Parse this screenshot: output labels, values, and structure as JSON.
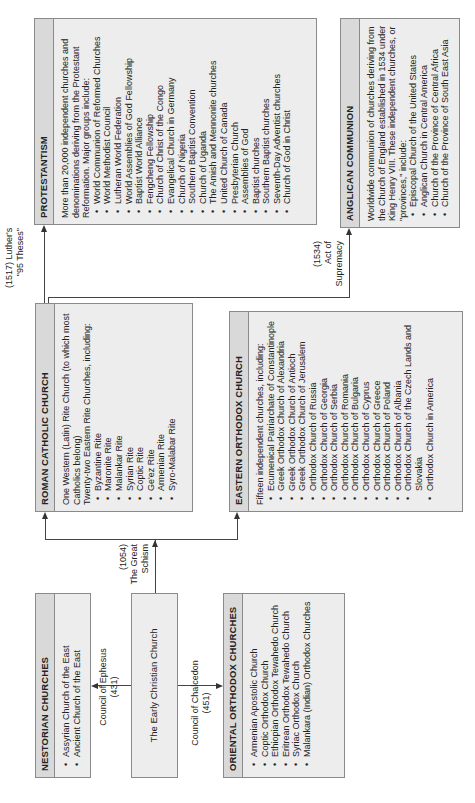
{
  "boxes": {
    "protestantism": {
      "title": "PROTESTANTISM",
      "intro": "More than 20,000 independent churches and denominations deriving from the Protestant Reformation. Major groups include:",
      "items": [
        "World Communion of Reformed Churches",
        "World Methodist Council",
        "Lutheran World Federation",
        "World Assemblies of God Fellowship",
        "Baptist World Alliance",
        "Fengcheng Fellowship",
        "Church of Christ of the Congo",
        "Evangelical Church in Germany",
        "Church of Nigeria",
        "Southern Baptist Convention",
        "Church of Uganda",
        "The Amish and Mennonite churches",
        "United Church of Canada",
        "Presbyterian Church",
        "Assemblies of God",
        "Baptist churches",
        "Southern Baptist churches",
        "Seventh-Day Adventist churches",
        "Church of God in Christ"
      ]
    },
    "anglican": {
      "title": "ANGLICAN COMMUNION",
      "intro": "Worldwide communion of churches deriving from the Church of England established in 1534 under King Henry VIII. These independent churches, or \"provinces,\" include:",
      "items": [
        "Episcopal Church of the United States",
        "Anglican Church in Central America",
        "Church of the Province of Central Africa",
        "Church of the Province of South East Asia"
      ]
    },
    "roman_catholic": {
      "title": "ROMAN CATHOLIC CHURCH",
      "intro": "One Western (Latin) Rite Church (to which most Catholics belong)",
      "intro2": "Twenty-two Eastern Rite Churches, including:",
      "items": [
        "Byzantine Rite",
        "Maronite Rite",
        "Malankar Rite",
        "Syrian Rite",
        "Coptic Rite",
        "Ge'ez Rite",
        "Armenian Rite",
        "Syro-Malabar Rite"
      ]
    },
    "eastern_orthodox": {
      "title": "EASTERN ORTHODOX CHURCH",
      "intro": "Fifteen independent churches, including:",
      "items": [
        "Ecumenical Patriarchate of Constantinople",
        "Greek Orthodox Church of Alexandria",
        "Greek Orthodox Church of Antioch",
        "Greek Orthodox Church of Jerusalem",
        "Orthodox Church of Russia",
        "Orthodox Church of Georgia",
        "Orthodox Church of Serbia",
        "Orthodox Church of Romania",
        "Orthodox Church of Bulgaria",
        "Orthodox Church of Cyprus",
        "Orthodox Church of Greece",
        "Orthodox Church of Poland",
        "Orthodox Church of Albania",
        "Orthodox Church of the Czech Lands and Slovakia",
        "Orthodox Church in America"
      ]
    },
    "nestorian": {
      "title": "NESTORIAN CHURCHES",
      "items": [
        "Assyrian Church of the East",
        "Ancient Church of the East"
      ]
    },
    "early_christian": {
      "title": "The Early Christian Church"
    },
    "oriental_orthodox": {
      "title": "ORIENTAL ORTHODOX CHURCHES",
      "items": [
        "Armenian Apostolic Church",
        "Coptic Orthodox Church",
        "Ethiopian Orthodox Tewahedo Church",
        "Eritrean Orthodox Tewahedo Church",
        "Syriac Orthodox Church",
        "Malankara (Indian) Orthodox Churches"
      ]
    }
  },
  "connectors": {
    "luther": {
      "line1": "(1517) Luther's",
      "line2": "\"95 Theses\""
    },
    "supremacy": {
      "line1": "(1534)",
      "line2": "Act of",
      "line3": "Supremacy"
    },
    "schism": {
      "line1": "(1054)",
      "line2": "The Great",
      "line3": "Schism"
    },
    "ephesus": {
      "line1": "Council of Ephesus",
      "line2": "(431)"
    },
    "chalcedon": {
      "line1": "Council of Chalcedon",
      "line2": "(451)"
    }
  },
  "colors": {
    "box_body": "#ededed",
    "box_header": "#d9d9d9",
    "border": "#8a8a8a",
    "line": "#444444"
  }
}
